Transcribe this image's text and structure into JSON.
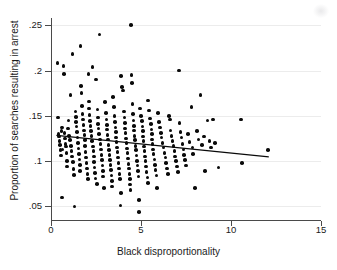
{
  "chart_data": {
    "type": "scatter",
    "title": "",
    "xlabel": "Black disproportionality",
    "ylabel": "Proportion of searches resulting in arrest",
    "xlim": [
      0,
      15
    ],
    "ylim": [
      0.035,
      0.258
    ],
    "xticks": [
      0,
      5,
      10,
      15
    ],
    "xtick_labels": [
      "0",
      "5",
      "10",
      "15"
    ],
    "yticks": [
      0.05,
      0.1,
      0.15,
      0.2,
      0.25
    ],
    "ytick_labels": [
      ".05",
      ".1",
      ".15",
      ".2",
      ".25"
    ],
    "grid": "horizontal-only",
    "legend": "none",
    "marker_color": "#0a0a0a",
    "marker_size": 3.6,
    "axis_color": "#4a4a4a",
    "grid_color": "#ececec",
    "background_color": "#ffffff",
    "series": [
      {
        "name": "agencies",
        "type": "scatter",
        "points": [
          [
            0.35,
            0.208
          ],
          [
            0.4,
            0.148
          ],
          [
            0.42,
            0.13
          ],
          [
            0.45,
            0.127
          ],
          [
            0.48,
            0.122
          ],
          [
            0.5,
            0.118
          ],
          [
            0.52,
            0.112
          ],
          [
            0.55,
            0.106
          ],
          [
            0.58,
            0.133
          ],
          [
            0.6,
            0.137
          ],
          [
            0.62,
            0.06
          ],
          [
            0.65,
            0.113
          ],
          [
            0.7,
            0.205
          ],
          [
            0.72,
            0.196
          ],
          [
            0.75,
            0.131
          ],
          [
            0.78,
            0.125
          ],
          [
            0.8,
            0.119
          ],
          [
            0.82,
            0.116
          ],
          [
            0.85,
            0.109
          ],
          [
            0.88,
            0.1
          ],
          [
            0.9,
            0.094
          ],
          [
            0.95,
            0.136
          ],
          [
            0.98,
            0.145
          ],
          [
            1.0,
            0.128
          ],
          [
            1.05,
            0.123
          ],
          [
            1.08,
            0.173
          ],
          [
            1.1,
            0.117
          ],
          [
            1.15,
            0.111
          ],
          [
            1.18,
            0.105
          ],
          [
            1.2,
            0.218
          ],
          [
            1.22,
            0.099
          ],
          [
            1.25,
            0.091
          ],
          [
            1.28,
            0.085
          ],
          [
            1.3,
            0.05
          ],
          [
            1.35,
            0.155
          ],
          [
            1.38,
            0.149
          ],
          [
            1.4,
            0.143
          ],
          [
            1.42,
            0.138
          ],
          [
            1.45,
            0.132
          ],
          [
            1.48,
            0.126
          ],
          [
            1.5,
            0.12
          ],
          [
            1.52,
            0.114
          ],
          [
            1.55,
            0.108
          ],
          [
            1.58,
            0.102
          ],
          [
            1.6,
            0.096
          ],
          [
            1.62,
            0.089
          ],
          [
            1.65,
            0.227
          ],
          [
            1.68,
            0.183
          ],
          [
            1.7,
            0.175
          ],
          [
            1.72,
            0.161
          ],
          [
            1.75,
            0.152
          ],
          [
            1.78,
            0.146
          ],
          [
            1.8,
            0.14
          ],
          [
            1.82,
            0.134
          ],
          [
            1.85,
            0.129
          ],
          [
            1.88,
            0.123
          ],
          [
            1.9,
            0.117
          ],
          [
            1.92,
            0.11
          ],
          [
            1.95,
            0.104
          ],
          [
            1.98,
            0.098
          ],
          [
            2.0,
            0.092
          ],
          [
            2.02,
            0.086
          ],
          [
            2.05,
            0.08
          ],
          [
            2.08,
            0.196
          ],
          [
            2.1,
            0.166
          ],
          [
            2.12,
            0.158
          ],
          [
            2.15,
            0.151
          ],
          [
            2.18,
            0.144
          ],
          [
            2.2,
            0.139
          ],
          [
            2.22,
            0.133
          ],
          [
            2.25,
            0.128
          ],
          [
            2.28,
            0.122
          ],
          [
            2.3,
            0.204
          ],
          [
            2.32,
            0.116
          ],
          [
            2.35,
            0.111
          ],
          [
            2.38,
            0.105
          ],
          [
            2.4,
            0.099
          ],
          [
            2.42,
            0.093
          ],
          [
            2.45,
            0.087
          ],
          [
            2.48,
            0.081
          ],
          [
            2.5,
            0.19
          ],
          [
            2.55,
            0.075
          ],
          [
            2.58,
            0.157
          ],
          [
            2.6,
            0.148
          ],
          [
            2.62,
            0.141
          ],
          [
            2.65,
            0.136
          ],
          [
            2.68,
            0.13
          ],
          [
            2.7,
            0.24
          ],
          [
            2.72,
            0.124
          ],
          [
            2.75,
            0.119
          ],
          [
            2.78,
            0.113
          ],
          [
            2.8,
            0.107
          ],
          [
            2.82,
            0.101
          ],
          [
            2.85,
            0.095
          ],
          [
            2.88,
            0.089
          ],
          [
            2.9,
            0.083
          ],
          [
            2.95,
            0.07
          ],
          [
            3.0,
            0.165
          ],
          [
            3.05,
            0.153
          ],
          [
            3.08,
            0.146
          ],
          [
            3.1,
            0.14
          ],
          [
            3.12,
            0.135
          ],
          [
            3.15,
            0.129
          ],
          [
            3.18,
            0.124
          ],
          [
            3.2,
            0.118
          ],
          [
            3.22,
            0.112
          ],
          [
            3.25,
            0.107
          ],
          [
            3.28,
            0.101
          ],
          [
            3.3,
            0.096
          ],
          [
            3.32,
            0.09
          ],
          [
            3.35,
            0.084
          ],
          [
            3.38,
            0.078
          ],
          [
            3.4,
            0.072
          ],
          [
            3.45,
            0.171
          ],
          [
            3.5,
            0.16
          ],
          [
            3.52,
            0.15
          ],
          [
            3.55,
            0.143
          ],
          [
            3.58,
            0.137
          ],
          [
            3.6,
            0.132
          ],
          [
            3.62,
            0.126
          ],
          [
            3.65,
            0.121
          ],
          [
            3.68,
            0.115
          ],
          [
            3.7,
            0.11
          ],
          [
            3.72,
            0.104
          ],
          [
            3.75,
            0.098
          ],
          [
            3.78,
            0.092
          ],
          [
            3.8,
            0.086
          ],
          [
            3.82,
            0.08
          ],
          [
            3.85,
            0.051
          ],
          [
            3.88,
            0.065
          ],
          [
            3.9,
            0.194
          ],
          [
            3.95,
            0.182
          ],
          [
            4.0,
            0.178
          ],
          [
            4.05,
            0.155
          ],
          [
            4.08,
            0.148
          ],
          [
            4.1,
            0.142
          ],
          [
            4.12,
            0.136
          ],
          [
            4.15,
            0.131
          ],
          [
            4.18,
            0.125
          ],
          [
            4.2,
            0.12
          ],
          [
            4.22,
            0.114
          ],
          [
            4.25,
            0.109
          ],
          [
            4.28,
            0.103
          ],
          [
            4.3,
            0.097
          ],
          [
            4.32,
            0.092
          ],
          [
            4.35,
            0.086
          ],
          [
            4.38,
            0.08
          ],
          [
            4.4,
            0.074
          ],
          [
            4.42,
            0.068
          ],
          [
            4.45,
            0.25
          ],
          [
            4.48,
            0.195
          ],
          [
            4.5,
            0.186
          ],
          [
            4.52,
            0.163
          ],
          [
            4.55,
            0.152
          ],
          [
            4.58,
            0.145
          ],
          [
            4.6,
            0.139
          ],
          [
            4.62,
            0.134
          ],
          [
            4.65,
            0.128
          ],
          [
            4.68,
            0.123
          ],
          [
            4.7,
            0.117
          ],
          [
            4.72,
            0.112
          ],
          [
            4.75,
            0.106
          ],
          [
            4.78,
            0.1
          ],
          [
            4.8,
            0.095
          ],
          [
            4.82,
            0.089
          ],
          [
            4.85,
            0.083
          ],
          [
            4.88,
            0.057
          ],
          [
            4.9,
            0.044
          ],
          [
            4.95,
            0.158
          ],
          [
            5.0,
            0.15
          ],
          [
            5.05,
            0.144
          ],
          [
            5.08,
            0.138
          ],
          [
            5.1,
            0.133
          ],
          [
            5.12,
            0.127
          ],
          [
            5.15,
            0.122
          ],
          [
            5.18,
            0.116
          ],
          [
            5.2,
            0.111
          ],
          [
            5.22,
            0.105
          ],
          [
            5.25,
            0.1
          ],
          [
            5.28,
            0.094
          ],
          [
            5.3,
            0.088
          ],
          [
            5.35,
            0.082
          ],
          [
            5.38,
            0.076
          ],
          [
            5.4,
            0.167
          ],
          [
            5.45,
            0.156
          ],
          [
            5.5,
            0.147
          ],
          [
            5.55,
            0.141
          ],
          [
            5.58,
            0.135
          ],
          [
            5.6,
            0.13
          ],
          [
            5.62,
            0.124
          ],
          [
            5.65,
            0.119
          ],
          [
            5.68,
            0.113
          ],
          [
            5.7,
            0.108
          ],
          [
            5.75,
            0.102
          ],
          [
            5.78,
            0.096
          ],
          [
            5.8,
            0.09
          ],
          [
            5.85,
            0.084
          ],
          [
            5.9,
            0.07
          ],
          [
            5.95,
            0.153
          ],
          [
            6.0,
            0.143
          ],
          [
            6.05,
            0.137
          ],
          [
            6.1,
            0.131
          ],
          [
            6.15,
            0.126
          ],
          [
            6.2,
            0.12
          ],
          [
            6.25,
            0.115
          ],
          [
            6.3,
            0.109
          ],
          [
            6.35,
            0.104
          ],
          [
            6.4,
            0.098
          ],
          [
            6.45,
            0.092
          ],
          [
            6.5,
            0.086
          ],
          [
            6.55,
            0.15
          ],
          [
            6.6,
            0.146
          ],
          [
            6.65,
            0.134
          ],
          [
            6.7,
            0.128
          ],
          [
            6.75,
            0.122
          ],
          [
            6.8,
            0.117
          ],
          [
            6.85,
            0.111
          ],
          [
            6.9,
            0.105
          ],
          [
            6.95,
            0.1
          ],
          [
            7.0,
            0.094
          ],
          [
            7.05,
            0.088
          ],
          [
            7.1,
            0.2
          ],
          [
            7.15,
            0.142
          ],
          [
            7.2,
            0.132
          ],
          [
            7.25,
            0.126
          ],
          [
            7.3,
            0.119
          ],
          [
            7.35,
            0.113
          ],
          [
            7.4,
            0.107
          ],
          [
            7.45,
            0.101
          ],
          [
            7.5,
            0.095
          ],
          [
            7.6,
            0.13
          ],
          [
            7.7,
            0.121
          ],
          [
            7.8,
            0.16
          ],
          [
            7.85,
            0.115
          ],
          [
            7.9,
            0.108
          ],
          [
            8.0,
            0.07
          ],
          [
            8.1,
            0.133
          ],
          [
            8.2,
            0.124
          ],
          [
            8.3,
            0.173
          ],
          [
            8.4,
            0.118
          ],
          [
            8.5,
            0.127
          ],
          [
            8.55,
            0.089
          ],
          [
            8.7,
            0.145
          ],
          [
            8.8,
            0.122
          ],
          [
            8.9,
            0.115
          ],
          [
            9.0,
            0.146
          ],
          [
            9.1,
            0.12
          ],
          [
            9.3,
            0.093
          ],
          [
            10.55,
            0.146
          ],
          [
            10.6,
            0.098
          ],
          [
            12.05,
            0.112
          ]
        ]
      },
      {
        "name": "linear-fit",
        "type": "line",
        "points": [
          [
            0.3,
            0.1285
          ],
          [
            12.1,
            0.1048
          ]
        ]
      }
    ]
  },
  "figure": {
    "background_color": "#ffffff",
    "width": 337,
    "height": 270
  }
}
